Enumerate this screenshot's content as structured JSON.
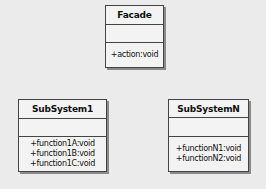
{
  "diagram": {
    "type": "UML class diagram",
    "classes": [
      {
        "name": "Facade",
        "attributes": [],
        "methods": [
          "+action:void"
        ]
      },
      {
        "name": "SubSystem1",
        "attributes": [],
        "methods": [
          "+function1A:void",
          "+function1B:void",
          "+function1C:void"
        ]
      },
      {
        "name": "SubSystemN",
        "attributes": [],
        "methods": [
          "+functionN1:void",
          "+functionN2:void"
        ]
      }
    ]
  },
  "colors": {
    "background": "#ebebeb",
    "box_fill": "#f3f3f3",
    "border": "#444444",
    "shadow": "#8a8a8a"
  }
}
